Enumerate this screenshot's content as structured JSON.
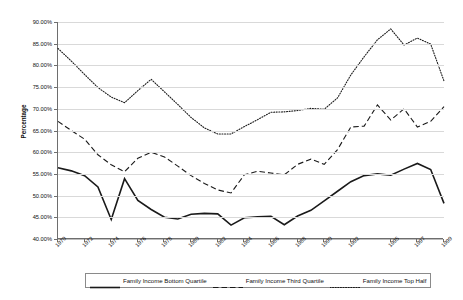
{
  "chart_data": {
    "type": "line",
    "title": "",
    "subtitle": "",
    "xlabel": "",
    "ylabel": "Percentage",
    "ylim": [
      40,
      90
    ],
    "ytick_format": "percent_2dp",
    "yticks": [
      40,
      45,
      50,
      55,
      60,
      65,
      70,
      75,
      80,
      85,
      90
    ],
    "ytick_labels": [
      "40.00%",
      "45.00%",
      "50.00%",
      "55.00%",
      "60.00%",
      "65.00%",
      "70.00%",
      "75.00%",
      "80.00%",
      "85.00%",
      "90.00%"
    ],
    "grid": "horizontal",
    "legend_position": "bottom",
    "x": [
      1970,
      1971,
      1972,
      1973,
      1974,
      1975,
      1976,
      1977,
      1978,
      1979,
      1980,
      1981,
      1982,
      1983,
      1984,
      1985,
      1986,
      1987,
      1988,
      1989,
      1990,
      1991,
      1992,
      1993,
      1994,
      1995,
      1996,
      1997,
      1998,
      1999
    ],
    "xticks": [
      1970,
      1972,
      1974,
      1976,
      1978,
      1980,
      1982,
      1984,
      1986,
      1988,
      1990,
      1992,
      1995,
      1997,
      1999
    ],
    "xtick_labels": [
      "1970",
      "1972",
      "1974",
      "1976",
      "1978",
      "1980",
      "1982",
      "1984",
      "1986",
      "1988",
      "1990",
      "1992",
      "1995",
      "1997",
      "1999"
    ],
    "xtick_rotation": -45,
    "series": [
      {
        "name": "Family Income Bottom Quartile",
        "style": "solid",
        "color": "#1a1a1a",
        "values": [
          56.4,
          55.7,
          54.6,
          52.0,
          44.5,
          53.9,
          48.9,
          46.8,
          45.0,
          44.6,
          45.7,
          45.9,
          45.8,
          43.2,
          44.9,
          45.1,
          45.2,
          43.3,
          45.3,
          46.6,
          48.8,
          51.0,
          53.2,
          54.6,
          55.0,
          54.7,
          56.1,
          57.4,
          56.0,
          48.2
        ]
      },
      {
        "name": "Family Income Third Quartile",
        "style": "dashed",
        "color": "#1a1a1a",
        "values": [
          67.1,
          65.0,
          63.0,
          59.4,
          57.1,
          55.5,
          58.6,
          60.0,
          58.9,
          56.8,
          54.6,
          52.8,
          51.3,
          50.6,
          54.8,
          55.6,
          55.2,
          54.8,
          57.2,
          58.4,
          57.2,
          60.6,
          65.8,
          66.0,
          70.9,
          67.4,
          70.0,
          65.8,
          67.1,
          70.5
        ]
      },
      {
        "name": "Family Income Top Half",
        "style": "dotted",
        "color": "#4d4d4d",
        "values": [
          83.9,
          81.0,
          77.9,
          74.9,
          72.7,
          71.4,
          74.2,
          76.8,
          73.9,
          71.0,
          68.0,
          65.6,
          64.2,
          64.2,
          65.9,
          67.5,
          69.2,
          69.3,
          69.6,
          70.1,
          69.9,
          72.5,
          77.8,
          82.0,
          85.9,
          88.4,
          84.7,
          86.3,
          84.9,
          76.4
        ]
      }
    ]
  },
  "legend": {
    "items": [
      {
        "label": "Family Income Bottom Quartile",
        "style": "solid"
      },
      {
        "label": "Family Income Third Quartile",
        "style": "dashed"
      },
      {
        "label": "Family Income Top Half",
        "style": "dotted"
      }
    ]
  }
}
